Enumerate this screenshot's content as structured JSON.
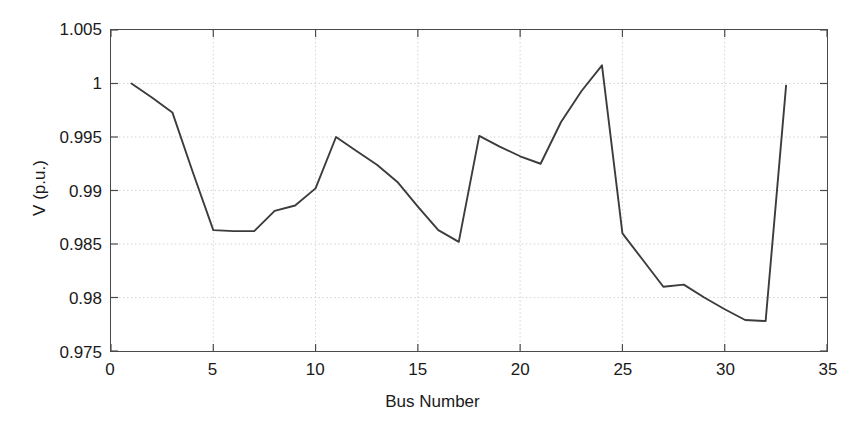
{
  "figure": {
    "background_color": "#ffffff",
    "line_color": "#3c3c3c",
    "axis_color": "#4a4a4a",
    "grid_color": "#c8c8c8"
  },
  "axes": {
    "xlabel": "Bus Number",
    "ylabel": "V (p.u.)",
    "x_ticks": [
      "0",
      "5",
      "10",
      "15",
      "20",
      "25",
      "30",
      "35"
    ],
    "y_ticks": [
      "0.975",
      "0.98",
      "0.985",
      "0.99",
      "0.995",
      "1",
      "1.005"
    ]
  },
  "chart_data": {
    "type": "line",
    "title": "",
    "xlabel": "Bus Number",
    "ylabel": "V (p.u.)",
    "xlim": [
      0,
      35
    ],
    "ylim": [
      0.975,
      1.005
    ],
    "xticks": [
      0,
      5,
      10,
      15,
      20,
      25,
      30,
      35
    ],
    "yticks": [
      0.975,
      0.98,
      0.985,
      0.99,
      0.995,
      1.0,
      1.005
    ],
    "grid": true,
    "legend": null,
    "series": [
      {
        "name": "Bus voltage magnitude",
        "x": [
          1,
          2,
          3,
          4,
          5,
          6,
          7,
          8,
          9,
          10,
          11,
          12,
          13,
          14,
          15,
          16,
          17,
          18,
          19,
          20,
          21,
          22,
          23,
          24,
          25,
          26,
          27,
          28,
          29,
          30,
          31,
          32,
          33
        ],
        "values": [
          1.0,
          0.9987,
          0.9973,
          0.9917,
          0.9863,
          0.9862,
          0.9862,
          0.9881,
          0.9886,
          0.9902,
          0.995,
          0.9937,
          0.9924,
          0.9908,
          0.9885,
          0.9863,
          0.9852,
          0.9951,
          0.9941,
          0.9932,
          0.9925,
          0.9964,
          0.9993,
          1.0017,
          0.986,
          0.9835,
          0.981,
          0.9812,
          0.98,
          0.9789,
          0.9779,
          0.9778,
          0.9998
        ]
      }
    ]
  }
}
